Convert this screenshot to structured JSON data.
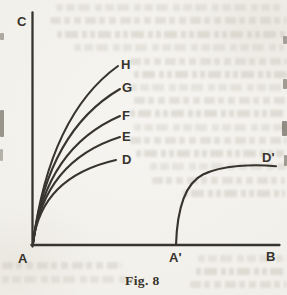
{
  "figure": {
    "caption": "Fig. 8",
    "axes": {
      "vertical_label": "C",
      "origin_label": "A",
      "horizontal_label": "B"
    },
    "curves_from_origin": [
      "H",
      "G",
      "F",
      "E",
      "D"
    ],
    "detached_curve": {
      "start_label": "A'",
      "end_label": "D'"
    },
    "ink_color": "#37332d",
    "paper_color": "#f1efe9",
    "ghost_color": "#c9c5bb"
  }
}
